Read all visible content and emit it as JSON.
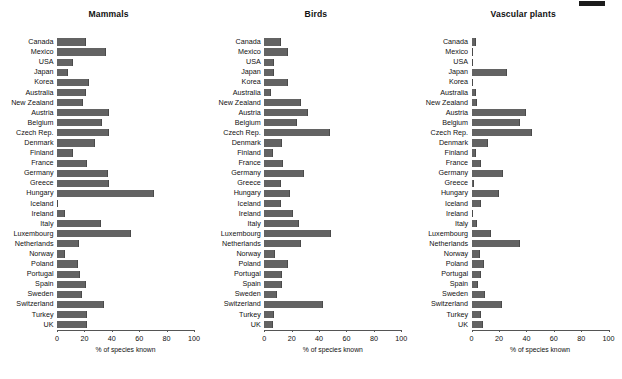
{
  "chart_data": [
    {
      "type": "bar",
      "title": "Mammals",
      "orientation": "horizontal",
      "xlabel": "% of species known",
      "ylabel": "",
      "xlim": [
        0,
        100
      ],
      "xticks": [
        0,
        20,
        40,
        60,
        80,
        100
      ],
      "grid": false,
      "legend": "none",
      "bar_color": "#636363",
      "categories": [
        "Canada",
        "Mexico",
        "USA",
        "Japan",
        "Korea",
        "Australia",
        "New Zealand",
        "Austria",
        "Belgium",
        "Czech Rep.",
        "Denmark",
        "Finland",
        "France",
        "Germany",
        "Greece",
        "Hungary",
        "Iceland",
        "Ireland",
        "Italy",
        "Luxembourg",
        "Netherlands",
        "Norway",
        "Poland",
        "Portugal",
        "Spain",
        "Sweden",
        "Switzerland",
        "Turkey",
        "UK"
      ],
      "values": [
        21,
        36,
        12,
        8,
        23,
        21,
        19,
        38,
        33,
        38,
        28,
        12,
        22,
        37,
        38,
        71,
        0,
        6,
        32,
        54,
        16,
        6,
        15,
        17,
        21,
        18,
        34,
        22,
        22
      ]
    },
    {
      "type": "bar",
      "title": "Birds",
      "orientation": "horizontal",
      "xlabel": "% of species known",
      "ylabel": "",
      "xlim": [
        0,
        100
      ],
      "xticks": [
        0,
        20,
        40,
        60,
        80,
        100
      ],
      "grid": false,
      "legend": "none",
      "bar_color": "#636363",
      "categories": [
        "Canada",
        "Mexico",
        "USA",
        "Japan",
        "Korea",
        "Australia",
        "New Zealand",
        "Austria",
        "Belgium",
        "Czech Rep.",
        "Denmark",
        "Finland",
        "France",
        "Germany",
        "Greece",
        "Hungary",
        "Iceland",
        "Ireland",
        "Italy",
        "Luxembourg",
        "Netherlands",
        "Norway",
        "Poland",
        "Portugal",
        "Spain",
        "Sweden",
        "Switzerland",
        "Turkey",
        "UK"
      ],
      "values": [
        12,
        17,
        7,
        7,
        17,
        5,
        27,
        32,
        24,
        48,
        13,
        6,
        14,
        29,
        12,
        19,
        12,
        21,
        25,
        49,
        27,
        8,
        17,
        13,
        13,
        9,
        43,
        7,
        6
      ]
    },
    {
      "type": "bar",
      "title": "Vascular plants",
      "orientation": "horizontal",
      "xlabel": "% of species known",
      "ylabel": "",
      "xlim": [
        0,
        100
      ],
      "xticks": [
        0,
        20,
        40,
        60,
        80,
        100
      ],
      "grid": false,
      "legend": "none",
      "bar_color": "#636363",
      "categories": [
        "Canada",
        "Mexico",
        "USA",
        "Japan",
        "Korea",
        "Australia",
        "New Zealand",
        "Austria",
        "Belgium",
        "Czech Rep.",
        "Denmark",
        "Finland",
        "France",
        "Germany",
        "Greece",
        "Hungary",
        "Iceland",
        "Ireland",
        "Italy",
        "Luxembourg",
        "Netherlands",
        "Norway",
        "Poland",
        "Portugal",
        "Spain",
        "Sweden",
        "Switzerland",
        "Turkey",
        "UK"
      ],
      "values": [
        3,
        1,
        0.5,
        26,
        0.5,
        3,
        4,
        40,
        35,
        44,
        12,
        3,
        7,
        23,
        2,
        20,
        7,
        0.5,
        4,
        14,
        35,
        6,
        9,
        7,
        5,
        10,
        22,
        7,
        8
      ]
    }
  ]
}
